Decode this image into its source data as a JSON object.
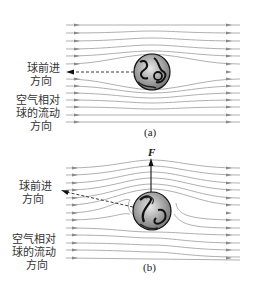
{
  "panels": [
    {
      "id": "a",
      "caption": "(a)",
      "ball_direction_label": [
        "球前进",
        "方向"
      ],
      "airflow_label": [
        "空气相对",
        "球的流动",
        "方向"
      ],
      "ball": {
        "cx": 152,
        "cy": 72,
        "r": 18
      }
    },
    {
      "id": "b",
      "caption": "(b)",
      "force_label": "F",
      "ball_direction_label": [
        "球前进",
        "方向"
      ],
      "airflow_label": [
        "空气相对",
        "球的流动",
        "方向"
      ],
      "ball": {
        "cx": 152,
        "cy": 211,
        "r": 19
      }
    }
  ],
  "colors": {
    "streamline": "#9a9a9a",
    "arrow": "#888888",
    "ball_outline": "#111111",
    "text": "#333333"
  }
}
